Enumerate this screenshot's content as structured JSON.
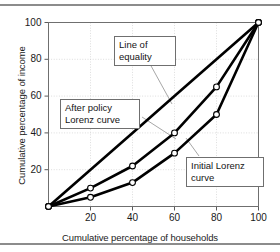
{
  "figure": {
    "has_top_rule": true,
    "has_bottom_rule": true,
    "rule_color": "#8c8c8c",
    "background": "#ffffff"
  },
  "annotations": {
    "line_of_equality": "Line of\nequality",
    "after_policy": "After policy\nLorenz curve",
    "initial_lorenz": "Initial Lorenz\ncurve"
  },
  "chart_data": {
    "type": "line",
    "title": "",
    "xlabel": "Cumulative percentage of households",
    "ylabel": "Cumulative percentage of income",
    "xlim": [
      0,
      100
    ],
    "ylim": [
      0,
      100
    ],
    "xticks": [
      20,
      40,
      60,
      80,
      100
    ],
    "yticks": [
      20,
      40,
      60,
      80,
      100
    ],
    "grid": true,
    "legend_position": "annotations",
    "line_color": "#000000",
    "marker_face_color": "#ffffff",
    "marker_edge_color": "#000000",
    "x": [
      0,
      20,
      40,
      60,
      80,
      100
    ],
    "series": [
      {
        "name": "Line of equality",
        "values": [
          0,
          20,
          40,
          60,
          80,
          100
        ],
        "markers_shown": [
          0,
          100
        ]
      },
      {
        "name": "After policy Lorenz curve",
        "values": [
          0,
          10,
          22,
          40,
          65,
          100
        ],
        "markers_shown": [
          0,
          10,
          22,
          40,
          65,
          100
        ]
      },
      {
        "name": "Initial Lorenz curve",
        "values": [
          0,
          5,
          13,
          29,
          50,
          100
        ],
        "markers_shown": [
          0,
          5,
          13,
          29,
          50,
          100
        ]
      }
    ]
  }
}
